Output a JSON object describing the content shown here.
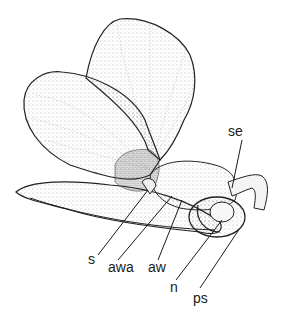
{
  "diagram": {
    "labels": [
      {
        "id": "se",
        "text": "se",
        "x": 236,
        "y": 127
      },
      {
        "id": "s",
        "text": "s",
        "x": 90,
        "y": 256
      },
      {
        "id": "awa",
        "text": "awa",
        "x": 110,
        "y": 262
      },
      {
        "id": "aw",
        "text": "aw",
        "x": 148,
        "y": 262
      },
      {
        "id": "n",
        "text": "n",
        "x": 170,
        "y": 282
      },
      {
        "id": "ps",
        "text": "ps",
        "x": 192,
        "y": 291
      }
    ]
  }
}
